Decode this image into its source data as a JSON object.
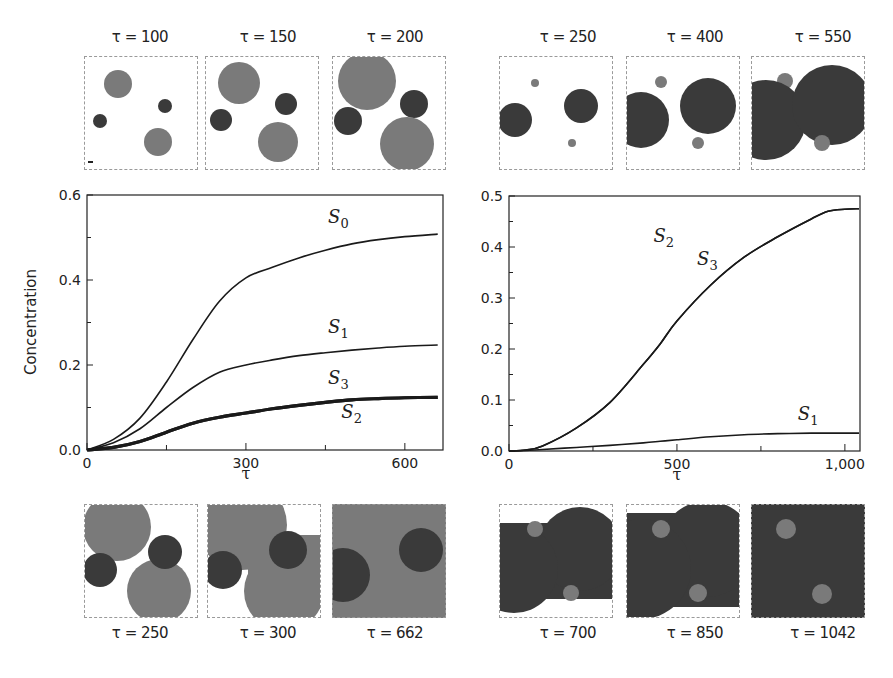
{
  "colors": {
    "background": "#ffffff",
    "species_light": "#7a7a7a",
    "species_dark": "#3a3a3a",
    "axis": "#222222",
    "frame": "#9a9a9a"
  },
  "top_left_snapshots": [
    {
      "label": "τ = 100"
    },
    {
      "label": "τ = 150"
    },
    {
      "label": "τ = 200"
    }
  ],
  "top_right_snapshots": [
    {
      "label": "τ = 250"
    },
    {
      "label": "τ = 400"
    },
    {
      "label": "τ = 550"
    }
  ],
  "bottom_left_snapshots": [
    {
      "label": "τ = 250"
    },
    {
      "label": "τ = 300"
    },
    {
      "label": "τ = 662"
    }
  ],
  "bottom_right_snapshots": [
    {
      "label": "τ = 700"
    },
    {
      "label": "τ = 850"
    },
    {
      "label": "τ = 1042"
    }
  ],
  "chart_data": [
    {
      "type": "line",
      "title": "",
      "xlabel": "τ",
      "ylabel": "Concentration",
      "xlim": [
        0,
        672
      ],
      "ylim": [
        0,
        0.6
      ],
      "xticks": [
        0,
        300,
        600
      ],
      "xtick_labels": [
        "0",
        "300",
        "600"
      ],
      "yticks": [
        0.0,
        0.2,
        0.4,
        0.6
      ],
      "ytick_labels": [
        "0.0",
        "0.2",
        "0.4",
        "0.6"
      ],
      "grid": false,
      "legend": "inline labels",
      "x": [
        0,
        50,
        100,
        150,
        200,
        250,
        300,
        350,
        400,
        450,
        500,
        550,
        600,
        662
      ],
      "series": [
        {
          "name": "S0",
          "label": "S",
          "sub": "0",
          "values": [
            0,
            0.025,
            0.075,
            0.16,
            0.26,
            0.35,
            0.405,
            0.43,
            0.452,
            0.47,
            0.485,
            0.495,
            0.502,
            0.508
          ]
        },
        {
          "name": "S1",
          "label": "S",
          "sub": "1",
          "values": [
            0,
            0.017,
            0.05,
            0.1,
            0.147,
            0.183,
            0.2,
            0.212,
            0.222,
            0.229,
            0.235,
            0.24,
            0.244,
            0.247
          ]
        },
        {
          "name": "S2",
          "label": "S",
          "sub": "2",
          "values": [
            0,
            0.006,
            0.02,
            0.042,
            0.063,
            0.077,
            0.087,
            0.097,
            0.105,
            0.112,
            0.118,
            0.121,
            0.123,
            0.124
          ]
        },
        {
          "name": "S3",
          "label": "S",
          "sub": "3",
          "values": [
            0,
            0.006,
            0.02,
            0.042,
            0.063,
            0.077,
            0.087,
            0.097,
            0.105,
            0.112,
            0.118,
            0.121,
            0.123,
            0.124
          ]
        }
      ],
      "annotations": [
        {
          "text": "S0",
          "x": 455,
          "y": 0.535
        },
        {
          "text": "S1",
          "x": 455,
          "y": 0.275
        },
        {
          "text": "S3",
          "x": 455,
          "y": 0.155
        },
        {
          "text": "S2",
          "x": 480,
          "y": 0.075
        }
      ]
    },
    {
      "type": "line",
      "title": "",
      "xlabel": "τ",
      "ylabel": "",
      "xlim": [
        0,
        1045
      ],
      "ylim": [
        0,
        0.5
      ],
      "xticks": [
        0,
        500,
        1000
      ],
      "xtick_labels": [
        "0",
        "500",
        "1,000"
      ],
      "yticks": [
        0.0,
        0.1,
        0.2,
        0.3,
        0.4,
        0.5
      ],
      "ytick_labels": [
        "0.0",
        "0.1",
        "0.2",
        "0.3",
        "0.4",
        "0.5"
      ],
      "grid": false,
      "legend": "inline labels",
      "x": [
        0,
        50,
        100,
        200,
        300,
        400,
        450,
        500,
        600,
        700,
        800,
        900,
        950,
        1000,
        1042
      ],
      "series": [
        {
          "name": "S2",
          "label": "S",
          "sub": "2",
          "values": [
            0,
            0.002,
            0.01,
            0.045,
            0.095,
            0.17,
            0.21,
            0.255,
            0.325,
            0.38,
            0.42,
            0.455,
            0.47,
            0.474,
            0.475
          ]
        },
        {
          "name": "S3",
          "label": "S",
          "sub": "3",
          "values": [
            0,
            0.002,
            0.01,
            0.045,
            0.095,
            0.17,
            0.21,
            0.255,
            0.325,
            0.38,
            0.42,
            0.455,
            0.47,
            0.474,
            0.475
          ]
        },
        {
          "name": "S1",
          "label": "S",
          "sub": "1",
          "values": [
            0,
            0.001,
            0.003,
            0.007,
            0.011,
            0.016,
            0.019,
            0.022,
            0.028,
            0.032,
            0.034,
            0.035,
            0.035,
            0.035,
            0.035
          ]
        }
      ],
      "annotations": [
        {
          "text": "S2",
          "x": 430,
          "y": 0.41
        },
        {
          "text": "S3",
          "x": 560,
          "y": 0.365
        },
        {
          "text": "S1",
          "x": 860,
          "y": 0.06
        }
      ]
    }
  ]
}
